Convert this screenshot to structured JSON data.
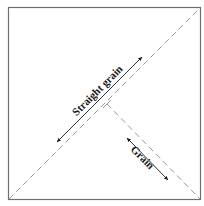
{
  "diagram": {
    "labels": {
      "straight_grain": "Straight grain",
      "grain": "Grain"
    },
    "colors": {
      "outline": "#6f6f6f",
      "dash": "#8a8a8a",
      "arrow": "#1a1a1a",
      "background": "#ffffff"
    }
  }
}
